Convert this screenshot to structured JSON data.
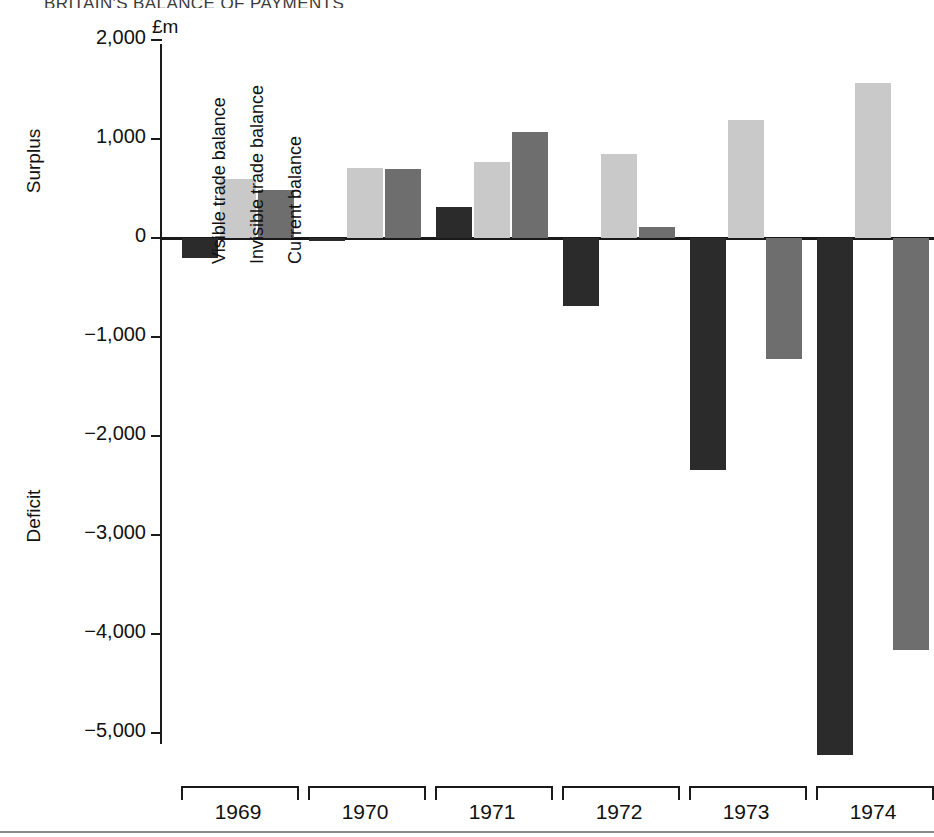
{
  "figure": {
    "title": "BRITAIN'S BALANCE OF PAYMENTS",
    "unit_label": "£m",
    "surplus_label": "Surplus",
    "deficit_label": "Deficit"
  },
  "colors": {
    "visible": "#2b2b2b",
    "invisible": "#c9c9c9",
    "current": "#6e6e6e",
    "axis": "#1a1a1a",
    "background": "#ffffff"
  },
  "inline_legend": [
    "Visible trade balance",
    "Invisible trade balance",
    "Current balance"
  ],
  "yticks": [
    "2,000",
    "1,000",
    "0",
    "−1,000",
    "−2,000",
    "−3,000",
    "−4,000",
    "−5,000"
  ],
  "years": [
    "1969",
    "1970",
    "1971",
    "1972",
    "1973",
    "1974"
  ],
  "chart_data": {
    "type": "bar",
    "title": "BRITAIN'S BALANCE OF PAYMENTS",
    "xlabel": "",
    "ylabel": "£m",
    "ylim": [
      -5500,
      2000
    ],
    "yticks": [
      2000,
      1000,
      0,
      -1000,
      -2000,
      -3000,
      -4000,
      -5000
    ],
    "grid": false,
    "legend_position": "inside-left",
    "categories": [
      "1969",
      "1970",
      "1971",
      "1972",
      "1973",
      "1974"
    ],
    "series": [
      {
        "name": "Visible trade balance",
        "color": "#2b2b2b",
        "values": [
          -200,
          -30,
          310,
          -690,
          -2340,
          -5220
        ]
      },
      {
        "name": "Invisible trade balance",
        "color": "#c9c9c9",
        "values": [
          600,
          710,
          770,
          850,
          1190,
          1570
        ]
      },
      {
        "name": "Current balance",
        "color": "#6e6e6e",
        "values": [
          480,
          700,
          1070,
          110,
          -1220,
          -4160
        ]
      }
    ],
    "annotations": [
      "Surplus",
      "Deficit"
    ]
  }
}
